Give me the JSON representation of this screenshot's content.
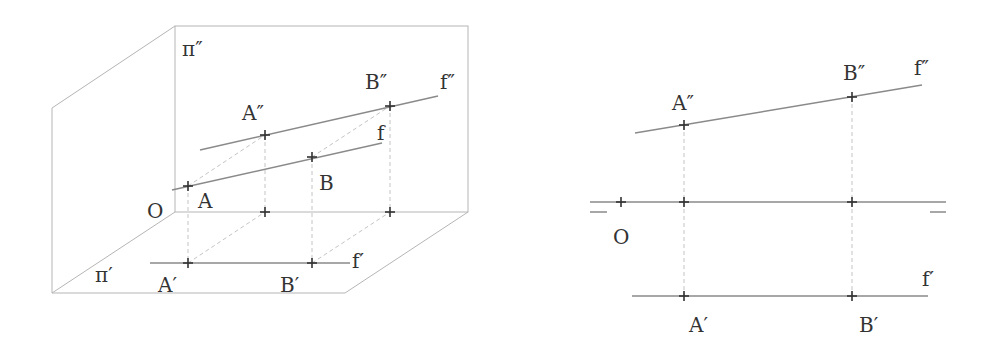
{
  "figure_left": {
    "title": "3D projection of frontal line f",
    "labels": {
      "pi2": "π″",
      "pi1": "π′",
      "origin": "O",
      "A2": "A″",
      "B2": "B″",
      "f2": "f″",
      "f": "f",
      "A": "A",
      "B": "B",
      "A1": "A′",
      "B1": "B′",
      "f1": "f′"
    }
  },
  "figure_right": {
    "title": "Orthographic (Monge) projection of frontal line f",
    "labels": {
      "origin": "O",
      "A2": "A″",
      "B2": "B″",
      "f2": "f″",
      "A1": "A′",
      "B1": "B′",
      "f1": "f′"
    }
  },
  "colors": {
    "edge": "#b5b5b5",
    "line": "#8a8a8a",
    "dashed": "#c4c4c4",
    "point": "#333333",
    "text": "#333333"
  }
}
